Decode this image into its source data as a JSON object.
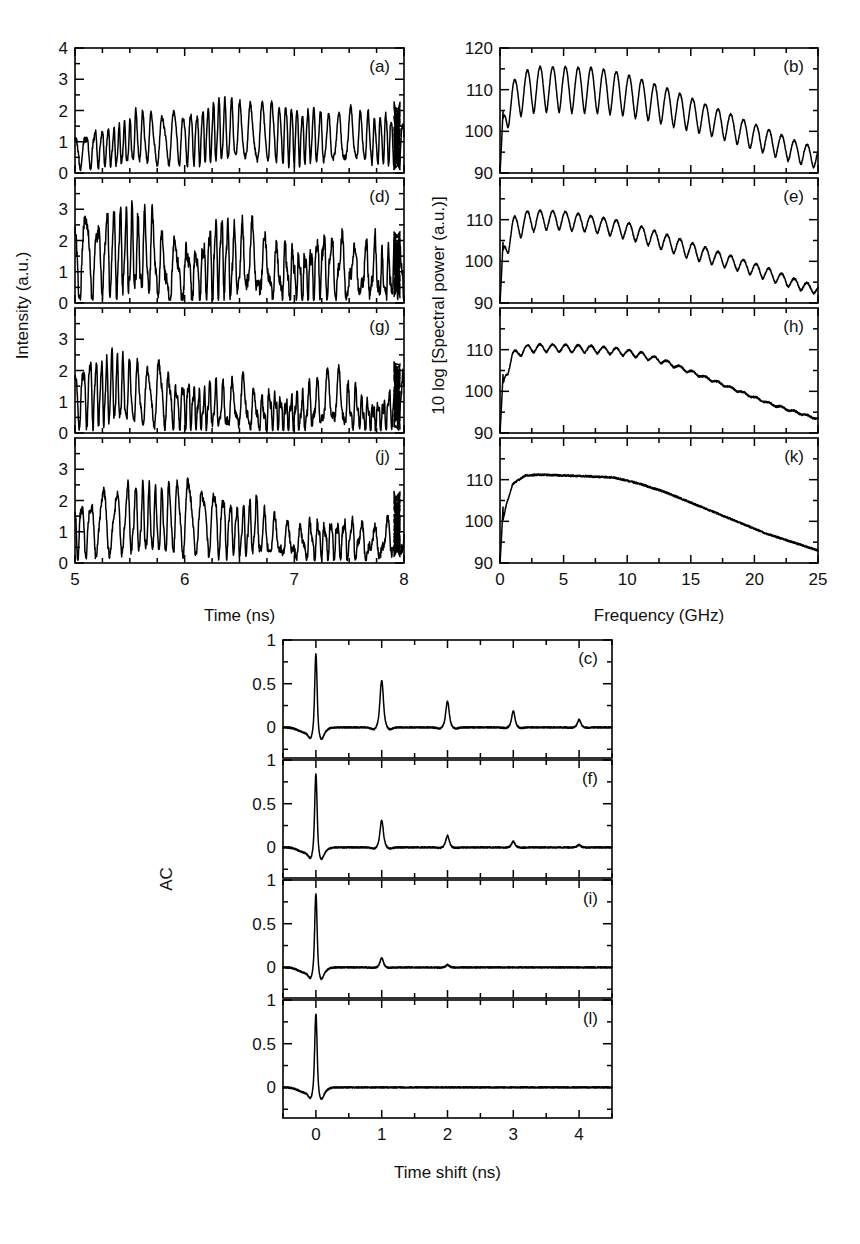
{
  "figure": {
    "kind": "multi-panel scientific figure",
    "panels_total": 12
  },
  "top_left_group": {
    "ylabel": "Intensity (a.u.)",
    "xlabel": "Time (ns)",
    "xticks": [
      "5",
      "6",
      "7",
      "8"
    ],
    "xlim": [
      5,
      8
    ],
    "panels": [
      {
        "tag": "(a)",
        "ylim": [
          0,
          4
        ],
        "yticks": [
          "0",
          "1",
          "2",
          "3",
          "4"
        ]
      },
      {
        "tag": "(d)",
        "ylim": [
          0,
          4
        ],
        "yticks": [
          "0",
          "1",
          "2",
          "3"
        ]
      },
      {
        "tag": "(g)",
        "ylim": [
          0,
          4
        ],
        "yticks": [
          "0",
          "1",
          "2",
          "3"
        ]
      },
      {
        "tag": "(j)",
        "ylim": [
          0,
          4
        ],
        "yticks": [
          "0",
          "1",
          "2",
          "3"
        ]
      }
    ]
  },
  "top_right_group": {
    "ylabel": "10 log [Spectral power (a.u.)]",
    "xlabel": "Frequency (GHz)",
    "xticks": [
      "0",
      "5",
      "10",
      "15",
      "20",
      "25"
    ],
    "xlim": [
      0,
      25
    ],
    "panels": [
      {
        "tag": "(b)",
        "ylim": [
          90,
          120
        ],
        "yticks": [
          "90",
          "100",
          "110",
          "120"
        ]
      },
      {
        "tag": "(e)",
        "ylim": [
          90,
          120
        ],
        "yticks": [
          "90",
          "100",
          "110"
        ]
      },
      {
        "tag": "(h)",
        "ylim": [
          90,
          120
        ],
        "yticks": [
          "90",
          "100",
          "110"
        ]
      },
      {
        "tag": "(k)",
        "ylim": [
          90,
          120
        ],
        "yticks": [
          "90",
          "100",
          "110"
        ]
      }
    ]
  },
  "bottom_group": {
    "ylabel": "AC",
    "xlabel": "Time shift (ns)",
    "xticks": [
      "0",
      "1",
      "2",
      "3",
      "4"
    ],
    "xlim": [
      -0.5,
      4.5
    ],
    "panels": [
      {
        "tag": "(c)",
        "ylim": [
          -0.35,
          1.0
        ],
        "yticks": [
          "0",
          "0.5",
          "1"
        ]
      },
      {
        "tag": "(f)",
        "ylim": [
          -0.35,
          1.0
        ],
        "yticks": [
          "0",
          "0.5",
          "1"
        ]
      },
      {
        "tag": "(i)",
        "ylim": [
          -0.35,
          1.0
        ],
        "yticks": [
          "0",
          "0.5",
          "1"
        ]
      },
      {
        "tag": "(l)",
        "ylim": [
          -0.35,
          1.0
        ],
        "yticks": [
          "0",
          "0.5",
          "1"
        ]
      }
    ]
  },
  "chart_data": [
    {
      "type": "line",
      "title": "(a) Intensity time series",
      "xlabel": "Time (ns)",
      "ylabel": "Intensity (a.u.)",
      "xlim": [
        5,
        8
      ],
      "ylim": [
        0,
        4
      ],
      "grid": false,
      "description": "Chaotic laser intensity, strong ~0.5 GHz relaxation oscillation with mean near 1.2, peaks up to 2.6",
      "params": {
        "seed": 11,
        "mean": 1.15,
        "amp": 0.72,
        "osc_freq": 16.5,
        "noise": 0.46,
        "npts": 1400,
        "peak": 2.6
      }
    },
    {
      "type": "line",
      "title": "(d) Intensity time series",
      "xlabel": "Time (ns)",
      "ylabel": "Intensity (a.u.)",
      "xlim": [
        5,
        8
      ],
      "ylim": [
        0,
        4
      ],
      "grid": false,
      "description": "Chaotic intensity with larger excursions, maximum spike ~3.5",
      "params": {
        "seed": 23,
        "mean": 1.2,
        "amp": 0.8,
        "osc_freq": 15.0,
        "noise": 0.58,
        "npts": 1400,
        "peak": 3.5
      }
    },
    {
      "type": "line",
      "title": "(g) Intensity time series",
      "xlabel": "Time (ns)",
      "ylabel": "Intensity (a.u.)",
      "xlim": [
        5,
        8
      ],
      "ylim": [
        0,
        4
      ],
      "grid": false,
      "description": "Chaotic intensity, peaks near 2.8",
      "params": {
        "seed": 37,
        "mean": 1.15,
        "amp": 0.78,
        "osc_freq": 17.0,
        "noise": 0.5,
        "npts": 1400,
        "peak": 2.9
      }
    },
    {
      "type": "line",
      "title": "(j) Intensity time series",
      "xlabel": "Time (ns)",
      "ylabel": "Intensity (a.u.)",
      "xlim": [
        5,
        8
      ],
      "ylim": [
        0,
        4
      ],
      "grid": false,
      "description": "Chaotic intensity, broadest fluctuation, peaks near 2.9",
      "params": {
        "seed": 59,
        "mean": 1.1,
        "amp": 0.75,
        "osc_freq": 14.0,
        "noise": 0.55,
        "npts": 1400,
        "peak": 2.9
      }
    },
    {
      "type": "line",
      "title": "(b) RF spectrum",
      "xlabel": "Frequency (GHz)",
      "ylabel": "10 log [Spectral power (a.u.)]",
      "xlim": [
        0,
        25
      ],
      "ylim": [
        90,
        120
      ],
      "grid": false,
      "description": "Broad chaotic spectrum with very deep, regular external-cavity ripple of 1 GHz period; envelope peaks ~115.5 dB near 3-8 GHz and falls to ~95 dB at 25 GHz",
      "envelope": {
        "x": [
          0,
          0.5,
          1,
          2,
          3,
          5,
          7,
          9,
          11,
          13,
          15,
          17,
          19,
          21,
          23,
          25
        ],
        "top": [
          99,
          108,
          112,
          114.5,
          115.5,
          115.5,
          115.3,
          114.5,
          112.5,
          110.5,
          108,
          105.5,
          103,
          100.5,
          98,
          96
        ],
        "bottom": [
          99,
          100,
          103,
          104,
          104.5,
          104.5,
          104.3,
          104,
          103,
          101.5,
          100,
          98.5,
          96.5,
          94.5,
          92.5,
          91
        ]
      },
      "ripple_period_ghz": 1.0
    },
    {
      "type": "line",
      "title": "(e) RF spectrum",
      "xlabel": "Frequency (GHz)",
      "ylabel": "10 log [Spectral power (a.u.)]",
      "xlim": [
        0,
        25
      ],
      "ylim": [
        90,
        120
      ],
      "grid": false,
      "description": "Broad spectrum with moderate 1 GHz ripple; peak ~112 dB near 3-6 GHz, decaying to ~92 dB at 25 GHz",
      "envelope": {
        "x": [
          0,
          0.5,
          1,
          2,
          3,
          5,
          7,
          9,
          11,
          13,
          15,
          17,
          19,
          21,
          23,
          25
        ],
        "top": [
          99,
          107,
          110.5,
          112,
          112.2,
          112,
          111,
          110,
          108.5,
          106.5,
          104.5,
          102.5,
          100.5,
          98.5,
          96,
          94
        ],
        "bottom": [
          99,
          101,
          104.5,
          106.5,
          107.5,
          107.5,
          107,
          106,
          104.5,
          102.5,
          100.5,
          99,
          97.5,
          95.5,
          93.5,
          92
        ]
      },
      "ripple_period_ghz": 1.0
    },
    {
      "type": "line",
      "title": "(h) RF spectrum",
      "xlabel": "Frequency (GHz)",
      "ylabel": "10 log [Spectral power (a.u.)]",
      "xlim": [
        0,
        25
      ],
      "ylim": [
        90,
        120
      ],
      "grid": false,
      "description": "Smoother spectrum with shallow 1 GHz ripple vanishing above ~12 GHz; plateau ~111 dB, falling to ~93 dB at 25 GHz",
      "envelope": {
        "x": [
          0,
          0.5,
          1,
          2,
          3,
          5,
          7,
          9,
          11,
          13,
          15,
          17,
          19,
          21,
          23,
          25
        ],
        "top": [
          98,
          106,
          109.5,
          111,
          111.3,
          111.2,
          111,
          110.5,
          109.5,
          107.5,
          105,
          102.5,
          100,
          97.5,
          95.5,
          93.5
        ],
        "bottom": [
          98,
          103,
          107.5,
          109,
          109.5,
          109.4,
          109.2,
          108.8,
          108,
          106.5,
          104.3,
          102,
          99.5,
          97,
          95,
          93.2
        ]
      },
      "ripple_period_ghz": 1.0
    },
    {
      "type": "line",
      "title": "(k) RF spectrum",
      "xlabel": "Frequency (GHz)",
      "ylabel": "10 log [Spectral power (a.u.)]",
      "xlim": [
        0,
        25
      ],
      "ylim": [
        90,
        120
      ],
      "grid": false,
      "description": "Featureless smooth chaotic spectrum, no ripple; flat plateau ~111 dB from 2 to 9 GHz then linear roll-off to ~93 dB at 25 GHz",
      "envelope": {
        "x": [
          0,
          0.5,
          1,
          2,
          3,
          5,
          7,
          9,
          11,
          13,
          15,
          17,
          19,
          21,
          23,
          25
        ],
        "top": [
          97,
          104,
          109,
          111,
          111.2,
          111,
          110.8,
          110.5,
          109,
          107,
          104.5,
          102,
          99.5,
          97,
          95,
          93
        ],
        "bottom": [
          97,
          104,
          109,
          111,
          111.2,
          111,
          110.8,
          110.5,
          109,
          107,
          104.5,
          102,
          99.5,
          97,
          95,
          93
        ]
      },
      "ripple_period_ghz": 0
    },
    {
      "type": "line",
      "title": "(c) Autocorrelation",
      "xlabel": "Time shift (ns)",
      "ylabel": "AC",
      "xlim": [
        -0.5,
        4.5
      ],
      "ylim": [
        -0.35,
        1.0
      ],
      "grid": false,
      "description": "Strong external-cavity echoes every 1 ns; zero-lag peak 1, echo amplitudes decaying slowly",
      "echoes": {
        "positions_ns": [
          0,
          1,
          2,
          3,
          4
        ],
        "amplitudes": [
          1.0,
          0.56,
          0.31,
          0.19,
          0.09
        ]
      }
    },
    {
      "type": "line",
      "title": "(f) Autocorrelation",
      "xlabel": "Time shift (ns)",
      "ylabel": "AC",
      "xlim": [
        -0.5,
        4.5
      ],
      "ylim": [
        -0.35,
        1.0
      ],
      "grid": false,
      "description": "Weaker echoes at 1 ns multiples, decaying faster",
      "echoes": {
        "positions_ns": [
          0,
          1,
          2,
          3,
          4
        ],
        "amplitudes": [
          1.0,
          0.32,
          0.14,
          0.07,
          0.03
        ]
      }
    },
    {
      "type": "line",
      "title": "(i) Autocorrelation",
      "xlabel": "Time shift (ns)",
      "ylabel": "AC",
      "xlim": [
        -0.5,
        4.5
      ],
      "ylim": [
        -0.35,
        1.0
      ],
      "grid": false,
      "description": "Single weak echo near 1 ns, residual correlation otherwise negligible",
      "echoes": {
        "positions_ns": [
          0,
          1,
          2,
          3,
          4
        ],
        "amplitudes": [
          1.0,
          0.11,
          0.03,
          0.0,
          0.0
        ]
      }
    },
    {
      "type": "line",
      "title": "(l) Autocorrelation",
      "xlabel": "Time shift (ns)",
      "ylabel": "AC",
      "xlim": [
        -0.5,
        4.5
      ],
      "ylim": [
        -0.35,
        1.0
      ],
      "grid": false,
      "description": "No time-delay signature; only the zero-lag spike",
      "echoes": {
        "positions_ns": [
          0,
          1,
          2,
          3,
          4
        ],
        "amplitudes": [
          1.0,
          0.0,
          0.0,
          0.0,
          0.0
        ]
      }
    }
  ]
}
